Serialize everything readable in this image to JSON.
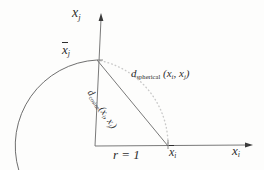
{
  "figure": {
    "background_color": "#fdfdfc",
    "ink_color": "#2e2e2e",
    "dotted_arc_color": "#c9c9c9",
    "labels": {
      "axis_j": "x",
      "axis_j_sub": "j",
      "xbar_j": "x",
      "xbar_j_sub": "j",
      "d_spherical_name": "d",
      "d_spherical_sub": "spherical",
      "d_spherical_args": "(x",
      "d_spherical_arg1_sub": "i",
      "d_spherical_sep": ", x",
      "d_spherical_arg2_sub": "j",
      "d_spherical_close": ")",
      "d_cosine_name": "d",
      "d_cosine_sub": "cosine",
      "d_cosine_args": "(x",
      "d_cosine_arg1_sub": "i",
      "d_cosine_sep": ", x",
      "d_cosine_arg2_sub": "j",
      "d_cosine_close": ")",
      "radius": "r = 1",
      "xbar_i": "x",
      "xbar_i_sub": "i",
      "axis_i": "x",
      "axis_i_sub": "i"
    },
    "geometry": {
      "origin": [
        95,
        146
      ],
      "unit_radius_px": 86,
      "point_xbar_i": [
        168,
        146
      ],
      "point_xbar_j": [
        97,
        60
      ],
      "vertical_axis_top": [
        101,
        16
      ],
      "horizontal_axis_right": [
        250,
        145
      ],
      "arc_solid_description": "large circle arc through xbar_j sweeping left and down off-canvas",
      "arc_dotted_description": "light dotted arc from xbar_j to xbar_i (spherical distance)",
      "chord_description": "solid straight segment from xbar_j to xbar_i (cosine distance)"
    }
  }
}
